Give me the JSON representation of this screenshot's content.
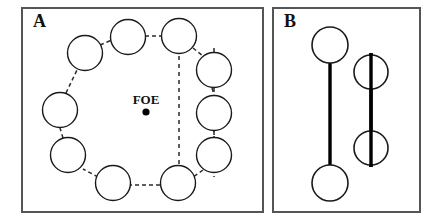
{
  "figure": {
    "width": 436,
    "height": 222,
    "background_color": "#ffffff",
    "line_color": "#1a1a1a",
    "frame_color": "#555555"
  },
  "panels": [
    {
      "id": "panel-a",
      "label": "A",
      "label_x": 33,
      "label_y": 27,
      "frame": {
        "x": 22,
        "y": 8,
        "width": 241,
        "height": 204
      },
      "annotation": {
        "text": "FOE",
        "text_x": 146,
        "text_y": 104,
        "dot_x": 146,
        "dot_y": 112,
        "dot_radius": 3.6
      },
      "ring_circles": [
        {
          "name": "circle-top-left-upper",
          "cx": 128,
          "cy": 37,
          "r": 17.5
        },
        {
          "name": "circle-top-right-upper",
          "cx": 179,
          "cy": 36,
          "r": 17.5
        },
        {
          "name": "circle-upper-left",
          "cx": 85,
          "cy": 53,
          "r": 17.5
        },
        {
          "name": "circle-right-upper",
          "cx": 214,
          "cy": 70,
          "r": 17.5
        },
        {
          "name": "circle-left-middle",
          "cx": 60,
          "cy": 110,
          "r": 17.5
        },
        {
          "name": "circle-right-middle",
          "cx": 214,
          "cy": 113,
          "r": 17.5
        },
        {
          "name": "circle-left-lower",
          "cx": 68,
          "cy": 155,
          "r": 17.5
        },
        {
          "name": "circle-right-lower",
          "cx": 214,
          "cy": 155,
          "r": 17.5
        },
        {
          "name": "circle-bottom-left",
          "cx": 113,
          "cy": 183,
          "r": 17.5
        },
        {
          "name": "circle-bottom-right",
          "cx": 178,
          "cy": 183,
          "r": 17.5
        }
      ],
      "connectors": [
        {
          "name": "connector-upperleft-topleft",
          "x1": 100,
          "y1": 45,
          "x2": 112,
          "y2": 40
        },
        {
          "name": "connector-topleft-topright",
          "x1": 145,
          "y1": 36,
          "x2": 162,
          "y2": 36
        },
        {
          "name": "connector-topright-rightupper",
          "x1": 192,
          "y1": 48,
          "x2": 203,
          "y2": 56
        },
        {
          "name": "connector-rightupper-rightmiddle",
          "x1": 211,
          "y1": 88,
          "x2": 214,
          "y2": 95
        },
        {
          "name": "connector-rightmiddle-rightlower",
          "x1": 214,
          "y1": 131,
          "x2": 214,
          "y2": 138
        },
        {
          "name": "connector-rightlower-bottomright",
          "x1": 203,
          "y1": 170,
          "x2": 192,
          "y2": 177
        },
        {
          "name": "connector-bottomright-bottomleft",
          "x1": 160,
          "y1": 184,
          "x2": 131,
          "y2": 184
        },
        {
          "name": "connector-bottomleft-leftlower",
          "x1": 98,
          "y1": 177,
          "x2": 83,
          "y2": 169
        },
        {
          "name": "connector-leftlower-leftmiddle",
          "x1": 63,
          "y1": 138,
          "x2": 60,
          "y2": 128
        },
        {
          "name": "connector-leftmiddle-upperleft",
          "x1": 66,
          "y1": 93,
          "x2": 76,
          "y2": 70
        }
      ],
      "axes": [
        {
          "name": "dashed-axis-inner",
          "x": 179,
          "y1": 40,
          "y2": 183
        },
        {
          "name": "dashed-axis-outer",
          "x": 214,
          "y1": 48,
          "y2": 177
        }
      ]
    },
    {
      "id": "panel-b",
      "label": "B",
      "label_x": 284,
      "label_y": 27,
      "frame": {
        "x": 273,
        "y": 8,
        "width": 147,
        "height": 204
      },
      "bar_circles": [
        {
          "name": "circle-left-top",
          "cx": 330,
          "cy": 45,
          "r": 18
        },
        {
          "name": "circle-left-bottom",
          "cx": 330,
          "cy": 183,
          "r": 18
        },
        {
          "name": "circle-right-top",
          "cx": 371,
          "cy": 72,
          "r": 17
        },
        {
          "name": "circle-right-bottom",
          "cx": 371,
          "cy": 148,
          "r": 17
        }
      ],
      "bars": [
        {
          "name": "bar-left-tangent",
          "x": 330,
          "y1": 63,
          "y2": 165
        },
        {
          "name": "bar-right-through",
          "x": 371,
          "y1": 53,
          "y2": 167
        }
      ]
    }
  ]
}
